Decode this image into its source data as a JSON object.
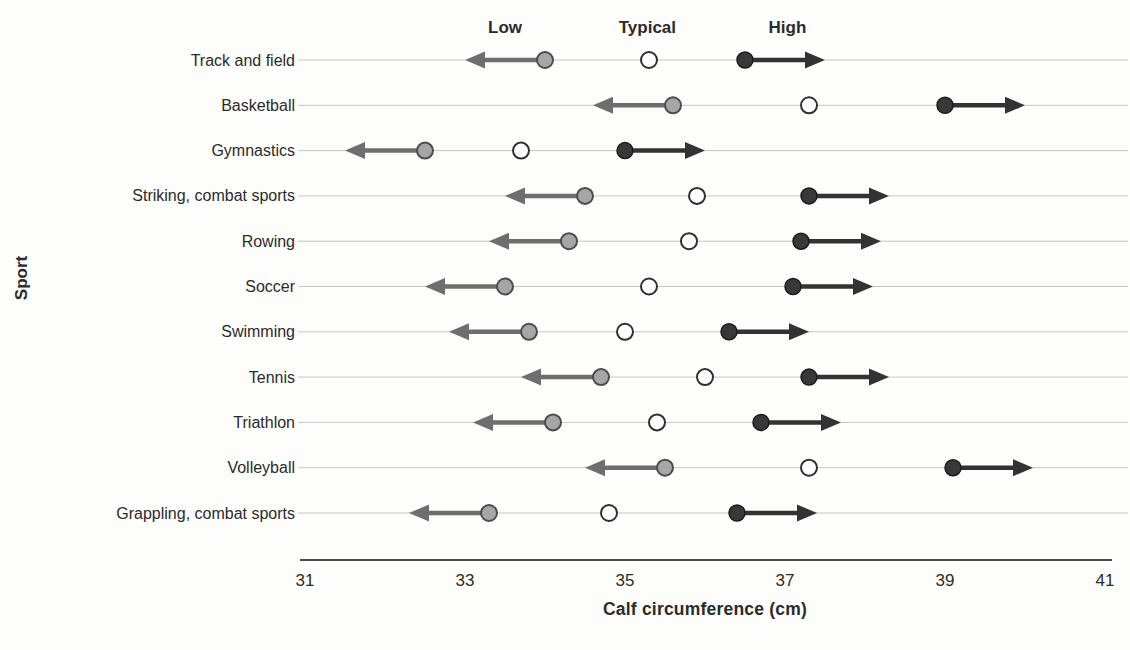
{
  "chart_data": {
    "type": "scatter",
    "title": "",
    "xlabel": "Calf circumference (cm)",
    "ylabel": "Sport",
    "xlim": [
      31,
      41
    ],
    "xticks": [
      31,
      33,
      35,
      37,
      39,
      41
    ],
    "grid": "horizontal-row-lines",
    "legend_position": "top-inside",
    "marker_legend": [
      {
        "label": "Low",
        "x_cm": 33.5
      },
      {
        "label": "Typical",
        "x_cm": 35.28
      },
      {
        "label": "High",
        "x_cm": 37.03
      }
    ],
    "arrow_length_cm": 1.0,
    "categories": [
      "Track and field",
      "Basketball",
      "Gymnastics",
      "Striking, combat sports",
      "Rowing",
      "Soccer",
      "Swimming",
      "Tennis",
      "Triathlon",
      "Volleyball",
      "Grappling, combat sports"
    ],
    "series": [
      {
        "name": "Low",
        "values": [
          34.0,
          35.6,
          32.5,
          34.5,
          34.3,
          33.5,
          33.8,
          34.7,
          34.1,
          35.5,
          33.3
        ]
      },
      {
        "name": "Typical",
        "values": [
          35.3,
          37.3,
          33.7,
          35.9,
          35.8,
          35.3,
          35.0,
          36.0,
          35.4,
          37.3,
          34.8
        ]
      },
      {
        "name": "High",
        "values": [
          36.5,
          39.0,
          35.0,
          37.3,
          37.2,
          37.1,
          36.3,
          37.3,
          36.7,
          39.1,
          36.4
        ]
      }
    ],
    "colors": {
      "low_fill": "#a6a6a6",
      "low_stroke": "#4d4d4d",
      "low_arrow": "#6e6e6e",
      "typical_fill": "#ffffff",
      "typical_stroke": "#2f2f2f",
      "high_fill": "#383838",
      "high_stroke": "#1c1c1c",
      "high_arrow": "#333333",
      "row_line": "#c6c6c6",
      "axis_line": "#4a4a4a",
      "text": "#2b2b2b",
      "background": "#fdfdfc"
    }
  }
}
